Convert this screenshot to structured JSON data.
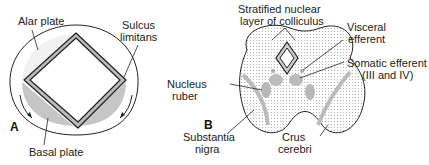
{
  "figure": {
    "panel_a": {
      "letter": "A",
      "labels": {
        "alar_plate": "Alar plate",
        "sulcus_limitans_1": "Sulcus",
        "sulcus_limitans_2": "limitans",
        "basal_plate": "Basal plate"
      }
    },
    "panel_b": {
      "letter": "B",
      "labels": {
        "stratified_1": "Stratified nuclear",
        "stratified_2": "layer of colliculus",
        "visceral_1": "Visceral",
        "visceral_2": "efferent",
        "somatic_1": "Somatic efferent",
        "somatic_2": "(III and IV)",
        "nucleus_ruber_1": "Nucleus",
        "nucleus_ruber_2": "ruber",
        "substantia_1": "Substantia",
        "substantia_2": "nigra",
        "crus_1": "Crus",
        "crus_2": "cerebri"
      }
    }
  }
}
